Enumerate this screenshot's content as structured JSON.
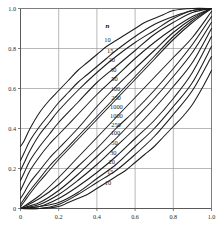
{
  "chart_data": {
    "type": "line",
    "title": "",
    "subtitle": "",
    "xlabel": "",
    "ylabel": "",
    "xlim": [
      0,
      1
    ],
    "ylim": [
      0,
      1
    ],
    "grid": true,
    "legend_position": "inside-center",
    "legend_title": "n",
    "x_ticks": [
      "0",
      "0.2",
      "0.4",
      "0.6",
      "0.8",
      "1.0"
    ],
    "x_tick_values": [
      0,
      0.2,
      0.4,
      0.6,
      0.8,
      1.0
    ],
    "y_ticks": [
      "0",
      "0.2",
      "0.4",
      "0.6",
      "0.8",
      "1.0"
    ],
    "y_tick_values": [
      0,
      0.2,
      0.4,
      0.6,
      0.8,
      1.0
    ],
    "sample_sizes": [
      10,
      15,
      20,
      30,
      50,
      100,
      250,
      1000
    ],
    "upper_labels": [
      "10",
      "15",
      "20",
      "30",
      "50",
      "100",
      "250",
      "1000"
    ],
    "lower_labels": [
      "1000",
      "250",
      "100",
      "50",
      "30",
      "20",
      "15",
      "10"
    ],
    "series": [
      {
        "name": "n=10 upper",
        "n": 10,
        "branch": "upper",
        "x": [
          0,
          0.02,
          0.05,
          0.1,
          0.15,
          0.2,
          0.25,
          0.3,
          0.35,
          0.4,
          0.45,
          0.5,
          0.55,
          0.6,
          0.65,
          0.7,
          0.75,
          0.8,
          0.9,
          1.0
        ],
        "values": [
          0.31,
          0.34,
          0.4,
          0.48,
          0.54,
          0.59,
          0.64,
          0.69,
          0.73,
          0.77,
          0.81,
          0.84,
          0.87,
          0.9,
          0.93,
          0.95,
          0.97,
          0.99,
          1.0,
          1.0
        ]
      },
      {
        "name": "n=10 lower",
        "n": 10,
        "branch": "lower",
        "x": [
          0,
          0.1,
          0.2,
          0.25,
          0.3,
          0.35,
          0.4,
          0.45,
          0.5,
          0.55,
          0.6,
          0.65,
          0.7,
          0.75,
          0.8,
          0.85,
          0.9,
          0.95,
          1.0
        ],
        "values": [
          0,
          0.0,
          0.01,
          0.03,
          0.05,
          0.07,
          0.1,
          0.13,
          0.16,
          0.19,
          0.23,
          0.27,
          0.31,
          0.36,
          0.41,
          0.46,
          0.52,
          0.6,
          0.69
        ]
      },
      {
        "name": "n=15 upper",
        "n": 15,
        "branch": "upper",
        "x": [
          0,
          0.02,
          0.05,
          0.1,
          0.15,
          0.2,
          0.25,
          0.3,
          0.35,
          0.4,
          0.45,
          0.5,
          0.6,
          0.7,
          0.8,
          0.9,
          1.0
        ],
        "values": [
          0.24,
          0.28,
          0.34,
          0.41,
          0.47,
          0.53,
          0.58,
          0.63,
          0.67,
          0.71,
          0.75,
          0.79,
          0.86,
          0.92,
          0.96,
          0.99,
          1.0
        ]
      },
      {
        "name": "n=15 lower",
        "n": 15,
        "branch": "lower",
        "x": [
          0,
          0.1,
          0.2,
          0.3,
          0.4,
          0.5,
          0.6,
          0.7,
          0.8,
          0.9,
          1.0
        ],
        "values": [
          0,
          0.0,
          0.02,
          0.07,
          0.13,
          0.19,
          0.27,
          0.36,
          0.47,
          0.59,
          0.76
        ]
      },
      {
        "name": "n=20 upper",
        "n": 20,
        "branch": "upper",
        "x": [
          0,
          0.02,
          0.05,
          0.1,
          0.15,
          0.2,
          0.3,
          0.4,
          0.5,
          0.6,
          0.7,
          0.8,
          0.9,
          1.0
        ],
        "values": [
          0.19,
          0.23,
          0.29,
          0.37,
          0.43,
          0.49,
          0.59,
          0.68,
          0.76,
          0.83,
          0.89,
          0.95,
          0.99,
          1.0
        ]
      },
      {
        "name": "n=20 lower",
        "n": 20,
        "branch": "lower",
        "x": [
          0,
          0.1,
          0.2,
          0.3,
          0.4,
          0.5,
          0.6,
          0.7,
          0.8,
          0.9,
          1.0
        ],
        "values": [
          0,
          0.01,
          0.03,
          0.08,
          0.15,
          0.22,
          0.31,
          0.4,
          0.51,
          0.63,
          0.81
        ]
      },
      {
        "name": "n=30 upper",
        "n": 30,
        "branch": "upper",
        "x": [
          0,
          0.02,
          0.05,
          0.1,
          0.15,
          0.2,
          0.3,
          0.4,
          0.5,
          0.6,
          0.7,
          0.8,
          0.9,
          1.0
        ],
        "values": [
          0.14,
          0.18,
          0.24,
          0.31,
          0.37,
          0.43,
          0.53,
          0.63,
          0.71,
          0.79,
          0.87,
          0.93,
          0.98,
          1.0
        ]
      },
      {
        "name": "n=30 lower",
        "n": 30,
        "branch": "lower",
        "x": [
          0,
          0.1,
          0.2,
          0.3,
          0.4,
          0.5,
          0.6,
          0.7,
          0.8,
          0.9,
          1.0
        ],
        "values": [
          0,
          0.01,
          0.05,
          0.11,
          0.18,
          0.26,
          0.35,
          0.44,
          0.55,
          0.68,
          0.86
        ]
      },
      {
        "name": "n=50 upper",
        "n": 50,
        "branch": "upper",
        "x": [
          0,
          0.02,
          0.05,
          0.1,
          0.15,
          0.2,
          0.3,
          0.4,
          0.5,
          0.6,
          0.7,
          0.8,
          0.9,
          1.0
        ],
        "values": [
          0.09,
          0.13,
          0.19,
          0.26,
          0.32,
          0.37,
          0.47,
          0.57,
          0.66,
          0.75,
          0.83,
          0.9,
          0.96,
          1.0
        ]
      },
      {
        "name": "n=50 lower",
        "n": 50,
        "branch": "lower",
        "x": [
          0,
          0.1,
          0.2,
          0.3,
          0.4,
          0.5,
          0.6,
          0.7,
          0.8,
          0.9,
          1.0
        ],
        "values": [
          0,
          0.02,
          0.07,
          0.14,
          0.22,
          0.31,
          0.4,
          0.5,
          0.61,
          0.73,
          0.9
        ]
      },
      {
        "name": "n=100 upper",
        "n": 100,
        "branch": "upper",
        "x": [
          0,
          0.02,
          0.05,
          0.1,
          0.15,
          0.2,
          0.3,
          0.4,
          0.5,
          0.6,
          0.7,
          0.8,
          0.9,
          1.0
        ],
        "values": [
          0.05,
          0.08,
          0.13,
          0.19,
          0.25,
          0.3,
          0.4,
          0.51,
          0.61,
          0.7,
          0.79,
          0.88,
          0.95,
          1.0
        ]
      },
      {
        "name": "n=100 lower",
        "n": 100,
        "branch": "lower",
        "x": [
          0,
          0.1,
          0.2,
          0.3,
          0.4,
          0.5,
          0.6,
          0.7,
          0.8,
          0.9,
          1.0
        ],
        "values": [
          0,
          0.03,
          0.09,
          0.17,
          0.26,
          0.35,
          0.45,
          0.55,
          0.66,
          0.78,
          0.93
        ]
      },
      {
        "name": "n=250 upper",
        "n": 250,
        "branch": "upper",
        "x": [
          0,
          0.02,
          0.05,
          0.1,
          0.15,
          0.2,
          0.3,
          0.4,
          0.5,
          0.6,
          0.7,
          0.8,
          0.9,
          1.0
        ],
        "values": [
          0.02,
          0.05,
          0.09,
          0.15,
          0.21,
          0.26,
          0.36,
          0.46,
          0.56,
          0.66,
          0.76,
          0.86,
          0.94,
          1.0
        ]
      },
      {
        "name": "n=250 lower",
        "n": 250,
        "branch": "lower",
        "x": [
          0,
          0.1,
          0.2,
          0.3,
          0.4,
          0.5,
          0.6,
          0.7,
          0.8,
          0.9,
          1.0
        ],
        "values": [
          0,
          0.05,
          0.12,
          0.21,
          0.3,
          0.4,
          0.49,
          0.59,
          0.7,
          0.82,
          0.96
        ]
      },
      {
        "name": "n=1000 upper",
        "n": 1000,
        "branch": "upper",
        "x": [
          0,
          0.02,
          0.05,
          0.1,
          0.15,
          0.2,
          0.3,
          0.4,
          0.5,
          0.6,
          0.7,
          0.8,
          0.9,
          1.0
        ],
        "values": [
          0.01,
          0.035,
          0.075,
          0.135,
          0.19,
          0.245,
          0.345,
          0.445,
          0.545,
          0.645,
          0.745,
          0.845,
          0.93,
          1.0
        ]
      },
      {
        "name": "n=1000 lower",
        "n": 1000,
        "branch": "lower",
        "x": [
          0,
          0.1,
          0.2,
          0.3,
          0.4,
          0.5,
          0.6,
          0.7,
          0.8,
          0.9,
          1.0
        ],
        "values": [
          0,
          0.065,
          0.155,
          0.255,
          0.355,
          0.455,
          0.555,
          0.655,
          0.755,
          0.855,
          0.985
        ]
      }
    ],
    "annotations": [
      {
        "text": "n",
        "x": 0.455,
        "y": 0.915,
        "role": "legend-title"
      },
      {
        "text": "10",
        "x": 0.455,
        "y": 0.845,
        "role": "upper-label"
      },
      {
        "text": "15",
        "x": 0.47,
        "y": 0.79,
        "role": "upper-label"
      },
      {
        "text": "20",
        "x": 0.478,
        "y": 0.742,
        "role": "upper-label"
      },
      {
        "text": "30",
        "x": 0.486,
        "y": 0.696,
        "role": "upper-label"
      },
      {
        "text": "50",
        "x": 0.492,
        "y": 0.648,
        "role": "upper-label"
      },
      {
        "text": "100",
        "x": 0.497,
        "y": 0.6,
        "role": "upper-label"
      },
      {
        "text": "250",
        "x": 0.5,
        "y": 0.556,
        "role": "upper-label"
      },
      {
        "text": "1000",
        "x": 0.502,
        "y": 0.508,
        "role": "upper-label"
      },
      {
        "text": "1000",
        "x": 0.502,
        "y": 0.462,
        "role": "lower-label"
      },
      {
        "text": "250",
        "x": 0.5,
        "y": 0.42,
        "role": "lower-label"
      },
      {
        "text": "100",
        "x": 0.497,
        "y": 0.378,
        "role": "lower-label"
      },
      {
        "text": "50",
        "x": 0.492,
        "y": 0.33,
        "role": "lower-label"
      },
      {
        "text": "30",
        "x": 0.486,
        "y": 0.28,
        "role": "lower-label"
      },
      {
        "text": "20",
        "x": 0.478,
        "y": 0.232,
        "role": "lower-label"
      },
      {
        "text": "15",
        "x": 0.47,
        "y": 0.186,
        "role": "lower-label"
      },
      {
        "text": "10",
        "x": 0.458,
        "y": 0.128,
        "role": "lower-label"
      }
    ],
    "colors": {
      "curve": "#1c1c1c",
      "grid": "#9a9a9a",
      "frame": "#6f6f6f",
      "text": "#2b2b2b",
      "background": "#ffffff"
    }
  }
}
